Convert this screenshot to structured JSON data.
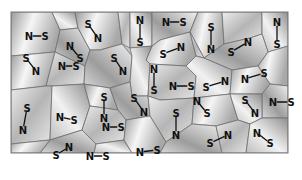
{
  "diagram": {
    "frame": {
      "x": 11,
      "y": 12,
      "width": 277,
      "height": 141
    },
    "colors": {
      "background": "#ffffff",
      "cell_light": "#f4f4f4",
      "cell_mid": "#c8c8c8",
      "cell_dark": "#8c8c8c",
      "cell_edge": "#6e6e6e",
      "label": "#111111"
    },
    "domains": [
      {
        "id": 1,
        "a": "N",
        "b": "S",
        "x1": 29,
        "y1": 36,
        "x2": 45,
        "y2": 36
      },
      {
        "id": 2,
        "a": "S",
        "b": "N",
        "x1": 88,
        "y1": 24,
        "x2": 98,
        "y2": 38
      },
      {
        "id": 3,
        "a": "N",
        "b": "S",
        "x1": 70,
        "y1": 46,
        "x2": 80,
        "y2": 58
      },
      {
        "id": 4,
        "a": "N",
        "b": "S",
        "x1": 140,
        "y1": 20,
        "x2": 140,
        "y2": 42
      },
      {
        "id": 5,
        "a": "S",
        "b": "N",
        "x1": 114,
        "y1": 58,
        "x2": 123,
        "y2": 71
      },
      {
        "id": 6,
        "a": "N",
        "b": "S",
        "x1": 62,
        "y1": 66,
        "x2": 76,
        "y2": 66
      },
      {
        "id": 7,
        "a": "S",
        "b": "N",
        "x1": 26,
        "y1": 58,
        "x2": 36,
        "y2": 71
      },
      {
        "id": 8,
        "a": "N",
        "b": "S",
        "x1": 166,
        "y1": 22,
        "x2": 183,
        "y2": 22
      },
      {
        "id": 9,
        "a": "S",
        "b": "N",
        "x1": 211,
        "y1": 27,
        "x2": 211,
        "y2": 49
      },
      {
        "id": 10,
        "a": "S",
        "b": "N",
        "x1": 163,
        "y1": 54,
        "x2": 181,
        "y2": 47
      },
      {
        "id": 11,
        "a": "S",
        "b": "N",
        "x1": 231,
        "y1": 52,
        "x2": 248,
        "y2": 42
      },
      {
        "id": 12,
        "a": "N",
        "b": "S",
        "x1": 277,
        "y1": 22,
        "x2": 277,
        "y2": 44
      },
      {
        "id": 13,
        "a": "N",
        "b": "S",
        "x1": 154,
        "y1": 69,
        "x2": 154,
        "y2": 90
      },
      {
        "id": 14,
        "a": "N",
        "b": "S",
        "x1": 173,
        "y1": 86,
        "x2": 191,
        "y2": 86
      },
      {
        "id": 15,
        "a": "S",
        "b": "N",
        "x1": 206,
        "y1": 87,
        "x2": 225,
        "y2": 81
      },
      {
        "id": 16,
        "a": "N",
        "b": "S",
        "x1": 245,
        "y1": 79,
        "x2": 264,
        "y2": 73
      },
      {
        "id": 17,
        "a": "N",
        "b": "S",
        "x1": 273,
        "y1": 102,
        "x2": 291,
        "y2": 102
      },
      {
        "id": 18,
        "a": "S",
        "b": "N",
        "x1": 245,
        "y1": 100,
        "x2": 255,
        "y2": 113
      },
      {
        "id": 19,
        "a": "N",
        "b": "S",
        "x1": 197,
        "y1": 101,
        "x2": 207,
        "y2": 113
      },
      {
        "id": 20,
        "a": "S",
        "b": "N",
        "x1": 176,
        "y1": 113,
        "x2": 176,
        "y2": 135
      },
      {
        "id": 21,
        "a": "S",
        "b": "N",
        "x1": 134,
        "y1": 98,
        "x2": 144,
        "y2": 112
      },
      {
        "id": 22,
        "a": "N",
        "b": "S",
        "x1": 106,
        "y1": 127,
        "x2": 121,
        "y2": 127
      },
      {
        "id": 23,
        "a": "S",
        "b": "N",
        "x1": 104,
        "y1": 97,
        "x2": 104,
        "y2": 118
      },
      {
        "id": 24,
        "a": "N",
        "b": "S",
        "x1": 60,
        "y1": 117,
        "x2": 74,
        "y2": 120
      },
      {
        "id": 25,
        "a": "S",
        "b": "N",
        "x1": 27,
        "y1": 108,
        "x2": 23,
        "y2": 130
      },
      {
        "id": 26,
        "a": "S",
        "b": "N",
        "x1": 56,
        "y1": 155,
        "x2": 69,
        "y2": 147
      },
      {
        "id": 27,
        "a": "N",
        "b": "S",
        "x1": 90,
        "y1": 156,
        "x2": 106,
        "y2": 156
      },
      {
        "id": 28,
        "a": "S",
        "b": "N",
        "x1": 210,
        "y1": 143,
        "x2": 228,
        "y2": 135
      },
      {
        "id": 29,
        "a": "N",
        "b": "S",
        "x1": 257,
        "y1": 133,
        "x2": 270,
        "y2": 143
      },
      {
        "id": 30,
        "a": "N",
        "b": "S",
        "x1": 140,
        "y1": 152,
        "x2": 157,
        "y2": 150
      },
      {
        "id": 31,
        "a": "S",
        "b": "N",
        "x1": 278,
        "y1": 65,
        "x2": 278,
        "y2": 65
      }
    ]
  }
}
